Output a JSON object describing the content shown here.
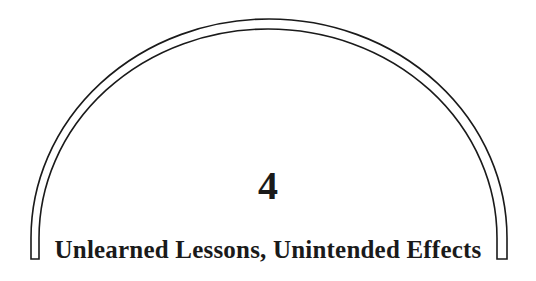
{
  "chapter": {
    "number": "4",
    "title": "Unlearned Lessons, Unintended Effects"
  },
  "colors": {
    "ink": "#1a1a1a",
    "background": "#ffffff"
  }
}
